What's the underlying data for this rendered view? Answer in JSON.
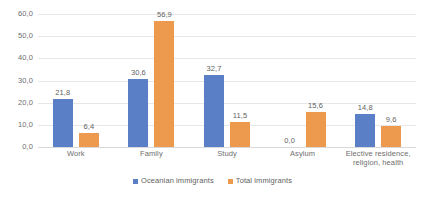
{
  "chart_data": {
    "type": "bar",
    "title": "",
    "subtitle": "",
    "xlabel": "",
    "ylabel": "",
    "ylim": [
      0,
      60
    ],
    "ytick_labels": [
      "60,0",
      "50,0",
      "40,0",
      "30,0",
      "20,0",
      "10,0",
      "0,0"
    ],
    "ytick_values": [
      60,
      50,
      40,
      30,
      20,
      10,
      0
    ],
    "grid": true,
    "legend_position": "bottom",
    "decimal_separator": ",",
    "categories": [
      "Work",
      "Family",
      "Study",
      "Asylum",
      "Elective residence, religion, health"
    ],
    "series": [
      {
        "name": "Oceanian immigrants",
        "color": "#5b7fc7",
        "values": [
          21.8,
          30.6,
          32.7,
          0.0,
          14.8
        ],
        "labels": [
          "21,8",
          "30,6",
          "32,7",
          "0,0",
          "14,8"
        ]
      },
      {
        "name": "Total immigrants",
        "color": "#ed9a4f",
        "values": [
          6.4,
          56.9,
          11.5,
          15.6,
          9.6
        ],
        "labels": [
          "6,4",
          "56,9",
          "11,5",
          "15,6",
          "9,6"
        ]
      }
    ]
  },
  "colors": {
    "series_oceanian": "#5b7fc7",
    "series_total": "#ed9a4f",
    "gridline": "#e6e6e6",
    "text": "#5f5f5f",
    "background": "#ffffff"
  }
}
